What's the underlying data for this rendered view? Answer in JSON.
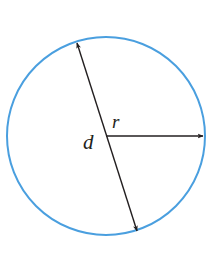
{
  "diagram": {
    "type": "circle-geometry",
    "colors": {
      "circle_stroke": "#4a9fdf",
      "line_stroke": "#231f20",
      "background": "#ffffff"
    },
    "circle": {
      "cx": 106,
      "cy": 136,
      "r": 99
    },
    "diameter": {
      "x1": 77,
      "y1": 43,
      "x2": 137,
      "y2": 231,
      "label": "d"
    },
    "radius": {
      "x1": 106,
      "y1": 136,
      "x2": 204,
      "y2": 136,
      "label": "r"
    }
  }
}
